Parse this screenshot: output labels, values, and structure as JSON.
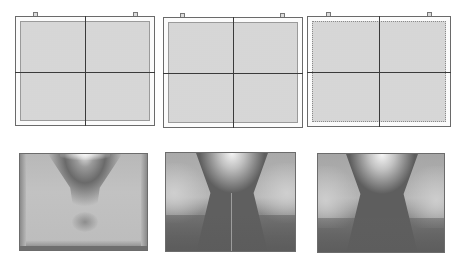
{
  "figure": {
    "colors": {
      "frame": "#6a6a6a",
      "fill": "#e2e2e2",
      "grid_line": "#3a3a3a",
      "sim_light": "#f2f2f2",
      "sim_mid": "#9a9a9a",
      "sim_dark": "#555555"
    },
    "schematics": [
      {
        "id": "schematic-1",
        "x": 15,
        "y": 16,
        "w": 140,
        "h": 110,
        "inner_inset": 5,
        "inner_border": "solid",
        "tabs": [
          33,
          133
        ]
      },
      {
        "id": "schematic-2",
        "x": 163,
        "y": 17,
        "w": 140,
        "h": 111,
        "inner_inset": 4,
        "inner_border": "solid",
        "tabs": [
          180,
          280
        ]
      },
      {
        "id": "schematic-3",
        "x": 307,
        "y": 16,
        "w": 144,
        "h": 111,
        "inner_inset": 4,
        "inner_border": "dotted",
        "tabs": [
          326,
          427
        ]
      }
    ],
    "simulations": [
      {
        "id": "simulation-1",
        "x": 19,
        "y": 153,
        "w": 129,
        "h": 98,
        "profile": "narrow funnel with banded tail"
      },
      {
        "id": "simulation-2",
        "x": 165,
        "y": 152,
        "w": 131,
        "h": 100,
        "profile": "wide funnel with dark lower plateau"
      },
      {
        "id": "simulation-3",
        "x": 317,
        "y": 153,
        "w": 128,
        "h": 100,
        "profile": "wide funnel with dark lower plateau"
      }
    ]
  }
}
